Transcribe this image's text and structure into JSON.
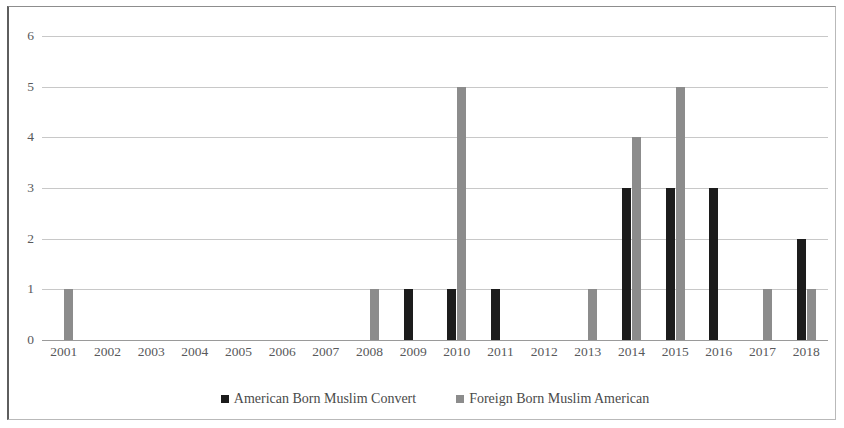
{
  "chart_data": {
    "type": "bar",
    "title": "",
    "subtitle": "",
    "xlabel": "",
    "ylabel": "",
    "categories": [
      "2001",
      "2002",
      "2003",
      "2004",
      "2005",
      "2006",
      "2007",
      "2008",
      "2009",
      "2010",
      "2011",
      "2012",
      "2013",
      "2014",
      "2015",
      "2016",
      "2017",
      "2018"
    ],
    "series": [
      {
        "name": "American Born Muslim Convert",
        "color": "#1c1c1c",
        "values": [
          0,
          0,
          0,
          0,
          0,
          0,
          0,
          0,
          1,
          1,
          1,
          0,
          0,
          3,
          3,
          3,
          0,
          2
        ]
      },
      {
        "name": "Foreign Born Muslim American",
        "color": "#8c8c8c",
        "values": [
          1,
          0,
          0,
          0,
          0,
          0,
          0,
          1,
          0,
          5,
          0,
          0,
          1,
          4,
          5,
          0,
          1,
          1
        ]
      }
    ],
    "ylim": [
      0,
      6
    ],
    "yticks": [
      0,
      1,
      2,
      3,
      4,
      5,
      6
    ],
    "ytick_labels": [
      "0",
      "1",
      "2",
      "3",
      "4",
      "5",
      "6"
    ],
    "grid": true,
    "grid_axis": "y",
    "legend_position": "bottom"
  },
  "legend": {
    "entries": [
      {
        "label": "American Born Muslim Convert",
        "swatch": "black-square-icon"
      },
      {
        "label": "Foreign Born Muslim American",
        "swatch": "gray-square-icon"
      }
    ]
  }
}
